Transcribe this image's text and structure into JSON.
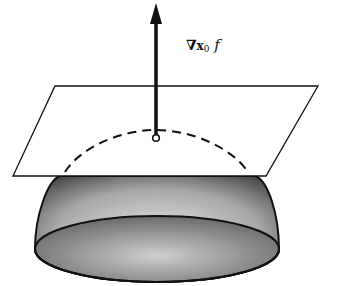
{
  "figure": {
    "label": {
      "nabla": "∇",
      "subscript": "x",
      "subscript_index": "0",
      "function": "f"
    },
    "colors": {
      "stroke": "#111111",
      "shade_dark": "#3a3a3a",
      "shade_light": "#d8d8d8",
      "background": "#ffffff"
    }
  }
}
